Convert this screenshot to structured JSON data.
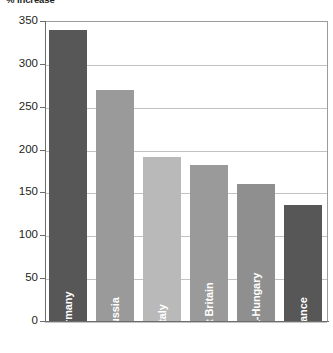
{
  "chart_data": {
    "type": "bar",
    "title": "% Increase",
    "xlabel": "",
    "ylabel": "",
    "ylim": [
      0,
      350
    ],
    "ytick_step": 50,
    "yticks": [
      350,
      300,
      250,
      200,
      150,
      100,
      50,
      0
    ],
    "grid": true,
    "legend": "none",
    "categories": [
      "Germany",
      "Russia",
      "Italy",
      "Great Britain",
      "Austria-Hungary",
      "France"
    ],
    "values": [
      340,
      270,
      191,
      182,
      160,
      135
    ],
    "bar_colors": [
      "#575757",
      "#9a9a9a",
      "#b9b9b9",
      "#9a9a9a",
      "#8f8f8f",
      "#575757"
    ],
    "label_color": "#ffffff",
    "axis_color": "#6d6d6d",
    "gridline_color": "#c3c3c3",
    "bars": [
      {
        "category": "Germany",
        "value": 340,
        "color": "#575757"
      },
      {
        "category": "Russia",
        "value": 270,
        "color": "#9a9a9a"
      },
      {
        "category": "Italy",
        "value": 191,
        "color": "#b9b9b9"
      },
      {
        "category": "Great Britain",
        "value": 182,
        "color": "#9a9a9a"
      },
      {
        "category": "Austria-Hungary",
        "value": 160,
        "color": "#8f8f8f"
      },
      {
        "category": "France",
        "value": 135,
        "color": "#575757"
      }
    ]
  }
}
